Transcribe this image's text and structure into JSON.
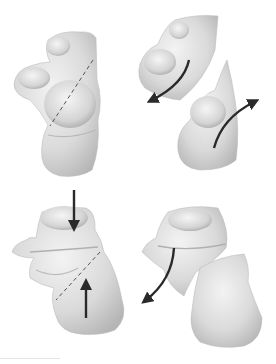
{
  "figure": {
    "panels": [
      {
        "id": "top-left",
        "label": "",
        "content": "intact bone with dashed fracture line"
      },
      {
        "id": "top-right",
        "label": "",
        "content": "fragments rotating apart with curved arrows"
      },
      {
        "id": "bottom-left",
        "label": "",
        "content": "bone with opposing compression arrows and dashed fracture line"
      },
      {
        "id": "bottom-right",
        "label": "",
        "content": "fragments separated with curved arrow"
      }
    ],
    "colors": {
      "bone_fill": "#dcdcdc",
      "bone_shadow": "#a8a8a8",
      "bone_highlight": "#f2f2f2",
      "arrow": "#2a2a2a",
      "dashed_line": "#555555",
      "background": "#ffffff"
    }
  }
}
